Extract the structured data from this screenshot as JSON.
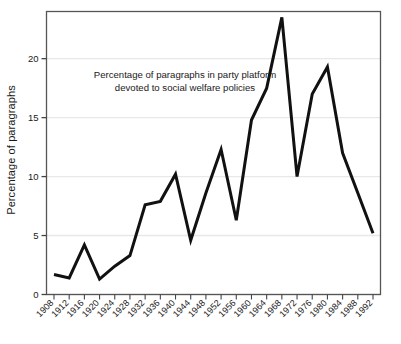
{
  "chart_data": {
    "type": "line",
    "title": "",
    "annotation": [
      "Percentage of paragraphs in party platform",
      "devoted to social welfare policies"
    ],
    "xlabel": "",
    "ylabel": "Percentage of paragraphs",
    "categories": [
      "1908",
      "1912",
      "1916",
      "1920",
      "1924",
      "1928",
      "1932",
      "1936",
      "1940",
      "1944",
      "1948",
      "1952",
      "1956",
      "1960",
      "1964",
      "1968",
      "1972",
      "1976",
      "1980",
      "1984",
      "1988",
      "1992"
    ],
    "values": [
      1.7,
      1.4,
      4.2,
      1.3,
      2.4,
      3.3,
      7.6,
      7.9,
      10.2,
      4.6,
      8.6,
      12.3,
      6.3,
      14.8,
      17.5,
      23.5,
      10.0,
      17.0,
      19.3,
      12.0,
      8.6,
      5.2
    ],
    "ylim": [
      0,
      24
    ],
    "yticks": [
      0,
      5,
      10,
      15,
      20
    ],
    "ytick_labels": [
      "0",
      "5",
      "10",
      "15",
      "20"
    ],
    "xlim": [
      "1908",
      "1992"
    ],
    "grid": true,
    "grid_axis": "y",
    "legend": null,
    "series_color": "#111111",
    "grid_color": "#e8e8e8",
    "frame_color": "#555555",
    "line_width": 3
  }
}
